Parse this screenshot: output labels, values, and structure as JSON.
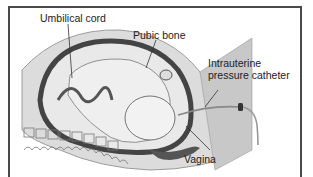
{
  "figure": {
    "type": "medical-illustration",
    "labels": {
      "umbilical_cord": "Umbilical cord",
      "pubic_bone": "Pubic bone",
      "catheter_line1": "Intrauterine",
      "catheter_line2": "pressure catheter",
      "vagina": "Vagina"
    },
    "colors": {
      "frame": "#4a4a4a",
      "uterine_wall": "#5a5a5a",
      "tissue": "#d4d4d4",
      "fetus": "#e8e8e8",
      "shadow": "#bdbdbd"
    }
  }
}
